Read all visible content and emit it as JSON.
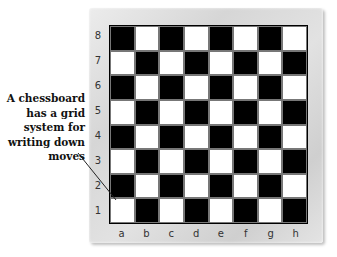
{
  "caption": {
    "lines": [
      "A chessboard",
      "has a grid",
      "system for",
      "writing down",
      "moves"
    ]
  },
  "board": {
    "ranks": [
      "8",
      "7",
      "6",
      "5",
      "4",
      "3",
      "2",
      "1"
    ],
    "files": [
      "a",
      "b",
      "c",
      "d",
      "e",
      "f",
      "g",
      "h"
    ],
    "labeled_squares": [
      "a1",
      "b2",
      "c3",
      "d4",
      "e5",
      "f6",
      "g7",
      "h8"
    ],
    "colors": {
      "dark": "#000000",
      "light": "#ffffff",
      "frame": "#d8d8d8",
      "label_text": "#ffffff"
    }
  },
  "pointer": {
    "from": [
      78,
      153
    ],
    "to": [
      116,
      200
    ],
    "target": "a1"
  }
}
